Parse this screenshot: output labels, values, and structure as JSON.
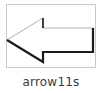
{
  "item": {
    "caption": "arrow11s",
    "icon": "left-arrow-shadow-icon",
    "colors": {
      "outline": "#b0b0b0",
      "shadow": "#1a1a1a",
      "frame": "#c8c8c8"
    }
  }
}
